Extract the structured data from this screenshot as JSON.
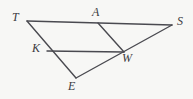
{
  "figure": {
    "width": 193,
    "height": 99,
    "background_color": "#f7f7f5",
    "stroke_color": "#4a4a50",
    "label_color": "#3b3b41",
    "stroke_width": 1.4
  },
  "chart_data": {
    "type": "diagram",
    "title": "",
    "subtype": "plane-geometry-line-figure",
    "points": [
      {
        "id": "T",
        "label": "T",
        "x": 27,
        "y": 21,
        "label_x": 12,
        "label_y": 11
      },
      {
        "id": "A",
        "label": "A",
        "x": 98,
        "y": 23,
        "label_x": 92,
        "label_y": 6
      },
      {
        "id": "S",
        "label": "S",
        "x": 172,
        "y": 25,
        "label_x": 177,
        "label_y": 15
      },
      {
        "id": "K",
        "label": "K",
        "x": 47,
        "y": 51,
        "label_x": 32,
        "label_y": 42
      },
      {
        "id": "W",
        "label": "W",
        "x": 124,
        "y": 52,
        "label_x": 122,
        "label_y": 52
      },
      {
        "id": "E",
        "label": "E",
        "x": 76,
        "y": 78,
        "label_x": 68,
        "label_y": 80
      }
    ],
    "segments": [
      {
        "id": "TS",
        "from": "T",
        "to": "S",
        "note": "passes through A"
      },
      {
        "id": "TE",
        "from": "T",
        "to": "E",
        "note": "passes through K"
      },
      {
        "id": "SE",
        "from": "S",
        "to": "E",
        "note": "passes through W"
      },
      {
        "id": "AW",
        "from": "A",
        "to": "W",
        "note": "transversal"
      },
      {
        "id": "KW",
        "from": "K",
        "to": "W",
        "note": "transversal, parallel to TS"
      }
    ],
    "legend": [],
    "annotations": []
  },
  "labels": {
    "T": "T",
    "A": "A",
    "S": "S",
    "K": "K",
    "W": "W",
    "E": "E"
  }
}
